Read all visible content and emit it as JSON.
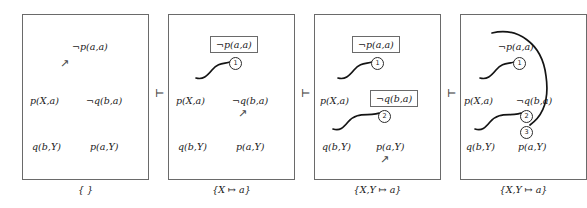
{
  "figure": {
    "separator": "⊢",
    "arrow_glyph": "↗",
    "panels": [
      {
        "name": "panel-1",
        "substitution": "{ }",
        "literals": {
          "top_right": "¬p(a,a)",
          "mid_left": "p(X,a)",
          "mid_right": "¬q(b,a)",
          "bot_left": "q(b,Y)",
          "bot_right": "p(a,Y)"
        },
        "boxed": [],
        "circles": [],
        "arrows": [
          "below-neg-p-a-a"
        ]
      },
      {
        "name": "panel-2",
        "substitution": "{X ↦ a}",
        "literals": {
          "top_right": "¬p(a,a)",
          "mid_left": "p(X,a)",
          "mid_right": "¬q(b,a)",
          "bot_left": "q(b,Y)",
          "bot_right": "p(a,Y)"
        },
        "boxed": [
          "¬p(a,a)"
        ],
        "circles": [
          "1"
        ],
        "arrows": [
          "below-neg-q-b-a"
        ]
      },
      {
        "name": "panel-3",
        "substitution": "{X,Y ↦ a}",
        "literals": {
          "top_right": "¬p(a,a)",
          "mid_left": "p(X,a)",
          "mid_right": "¬q(b,a)",
          "bot_left": "q(b,Y)",
          "bot_right": "p(a,Y)"
        },
        "boxed": [
          "¬p(a,a)",
          "¬q(b,a)"
        ],
        "circles": [
          "1",
          "2"
        ],
        "arrows": [
          "below-p-a-Y"
        ]
      },
      {
        "name": "panel-4",
        "substitution": "{X,Y ↦ a}",
        "literals": {
          "top_right": "¬p(a,a)",
          "mid_left": "p(X,a)",
          "mid_right": "¬q(b,a)",
          "bot_left": "q(b,Y)",
          "bot_right": "p(a,Y)"
        },
        "boxed": [],
        "circles": [
          "1",
          "2",
          "3"
        ],
        "arrows": []
      }
    ],
    "colors": {
      "ink": "#1a1a1a",
      "bracket": "#6a6a6a",
      "link": "#141414",
      "background": "#ffffff"
    }
  }
}
